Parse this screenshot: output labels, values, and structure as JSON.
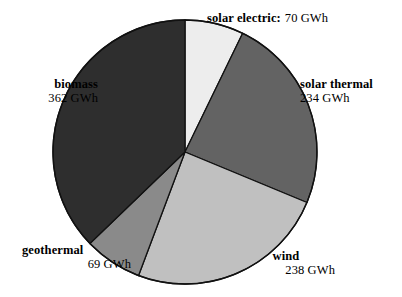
{
  "chart_data": {
    "type": "pie",
    "title": "",
    "unit": "GWh",
    "total": 973,
    "legend_position": "outside-callouts",
    "grid": false,
    "categories": [
      "solar electric",
      "solar thermal",
      "wind",
      "geothermal",
      "biomass"
    ],
    "values": [
      70,
      234,
      238,
      69,
      362
    ],
    "slices": [
      {
        "name": "solar electric",
        "label": "solar electric:",
        "value": 70,
        "value_text": "70 GWh",
        "color": "#ededed",
        "start_angle": 0,
        "end_angle": 25.9
      },
      {
        "name": "solar thermal",
        "label": "solar thermal",
        "value": 234,
        "value_text": "234 GWh",
        "color": "#636363",
        "start_angle": 25.9,
        "end_angle": 112.5
      },
      {
        "name": "wind",
        "label": "wind",
        "value": 238,
        "value_text": "238 GWh",
        "color": "#c0c0c0",
        "start_angle": 112.5,
        "end_angle": 200.6
      },
      {
        "name": "geothermal",
        "label": "geothermal",
        "value": 69,
        "value_text": "69 GWh",
        "color": "#8a8a8a",
        "start_angle": 200.6,
        "end_angle": 226.1
      },
      {
        "name": "biomass",
        "label": "biomass",
        "value": 362,
        "value_text": "362 GWh",
        "color": "#2e2e2e",
        "start_angle": 226.1,
        "end_angle": 360
      }
    ]
  },
  "colors": {
    "background": "#ffffff",
    "outline": "#111111",
    "text": "#000000"
  }
}
